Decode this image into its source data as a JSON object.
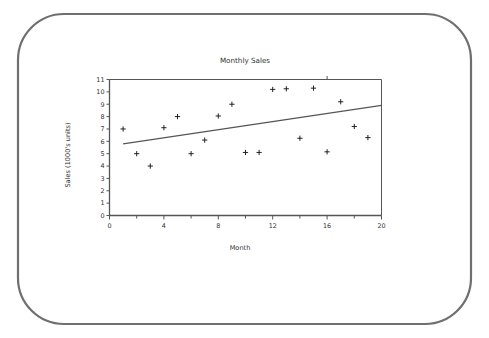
{
  "bezel": {
    "name": "screen-bezel",
    "stroke_color": "#6f6f6f",
    "corner_radius": 46
  },
  "chart_data": {
    "type": "scatter",
    "title": "Monthly Sales",
    "xlabel": "Month",
    "ylabel": "Sales (1000's units)",
    "xlim": [
      0,
      20
    ],
    "ylim": [
      0,
      11
    ],
    "grid": false,
    "legend": "none",
    "x_major_ticks": [
      0,
      4,
      8,
      12,
      16,
      20
    ],
    "x_major_tick_labels": [
      "0",
      "4",
      "8",
      "12",
      "16",
      "20"
    ],
    "x_minor_ticks": [
      2,
      6,
      10,
      14,
      18
    ],
    "y_ticks": [
      0,
      1,
      2,
      3,
      4,
      5,
      6,
      7,
      8,
      9,
      10,
      11
    ],
    "y_tick_labels": [
      "0",
      "1",
      "2",
      "3",
      "4",
      "5",
      "6",
      "7",
      "8",
      "9",
      "10",
      "11"
    ],
    "marker": "plus",
    "marker_color": "#222222",
    "line_color": "#555555",
    "axis_color": "#555555",
    "x": [
      1,
      2,
      3,
      4,
      5,
      6,
      7,
      8,
      9,
      10,
      11,
      12,
      13,
      14,
      15,
      16,
      17,
      18,
      19
    ],
    "y": [
      7.0,
      5.0,
      4.0,
      7.1,
      8.0,
      5.0,
      6.1,
      8.05,
      9.0,
      5.1,
      5.1,
      10.2,
      10.25,
      6.25,
      10.3,
      5.15,
      9.2,
      7.2,
      6.3
    ],
    "series": [
      {
        "name": "Sales",
        "type": "scatter",
        "values": [
          7.0,
          5.0,
          4.0,
          7.1,
          8.0,
          5.0,
          6.1,
          8.05,
          9.0,
          5.1,
          5.1,
          10.2,
          10.25,
          6.25,
          10.3,
          5.15,
          9.2,
          7.2,
          6.3
        ]
      },
      {
        "name": "Trend",
        "type": "line",
        "x": [
          1,
          20
        ],
        "values": [
          5.8,
          8.9
        ]
      }
    ],
    "trendline": {
      "x_start": 1,
      "y_start": 5.8,
      "x_end": 20,
      "y_end": 8.9
    }
  }
}
